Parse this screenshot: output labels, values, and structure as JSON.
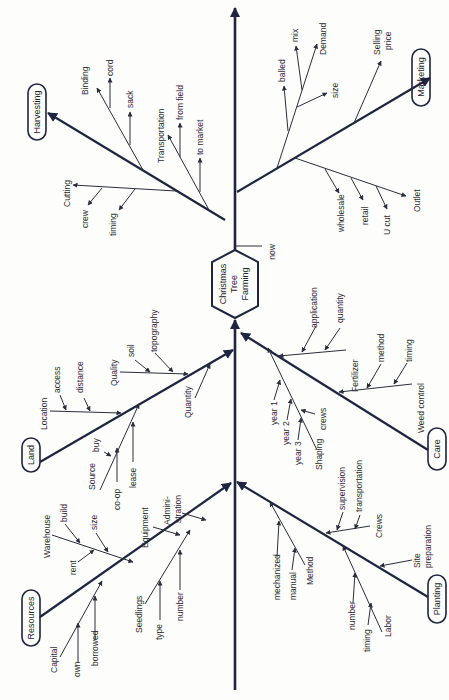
{
  "diagram": {
    "type": "fishbone",
    "head": "Christmas Tree Farming",
    "head_side_label": "now",
    "colors": {
      "ink": "#1f2440",
      "paper": "#fdfdfb"
    },
    "categories": {
      "harvesting": {
        "label": "Harvesting",
        "causes": [
          {
            "label": "Binding",
            "sub": [
              "cord",
              "sack"
            ]
          },
          {
            "label": "Transportation",
            "sub": [
              "from field",
              "to market"
            ]
          },
          {
            "label": "Cutting",
            "sub": [
              "crew",
              "timing"
            ]
          }
        ]
      },
      "marketing": {
        "label": "Marketing",
        "causes": [
          {
            "label": "Demand",
            "sub": [
              "balled",
              "mix",
              "size"
            ]
          },
          {
            "label": "Selling price",
            "sub": []
          },
          {
            "label": "Outlet",
            "sub": [
              "wholesale",
              "retail",
              "U cut"
            ]
          }
        ]
      },
      "land": {
        "label": "Land",
        "causes": [
          {
            "label": "Location",
            "sub": [
              "access",
              "distance"
            ]
          },
          {
            "label": "Quality",
            "sub": [
              "soil",
              "topography"
            ]
          },
          {
            "label": "Quantity",
            "sub": []
          },
          {
            "label": "Source",
            "sub": [
              "buy",
              "co-op",
              "lease"
            ]
          }
        ]
      },
      "care": {
        "label": "Care",
        "causes": [
          {
            "label": "Fertilizer",
            "sub": [
              "application",
              "quantity"
            ]
          },
          {
            "label": "Weed control",
            "sub": [
              "method",
              "timing"
            ]
          },
          {
            "label": "Shaping",
            "sub": [
              "year 1",
              "year 2",
              "year 3",
              "crews"
            ]
          }
        ]
      },
      "resources": {
        "label": "Resources",
        "causes": [
          {
            "label": "Warehouse",
            "sub": [
              "build",
              "size",
              "rent"
            ]
          },
          {
            "label": "Equipment",
            "sub": []
          },
          {
            "label": "Admini-",
            "label2": "stration",
            "sub": []
          },
          {
            "label": "Capital",
            "sub": [
              "own",
              "borrowed"
            ]
          },
          {
            "label": "Seedlings",
            "sub": [
              "type",
              "number"
            ]
          }
        ]
      },
      "planting": {
        "label": "Planting",
        "causes": [
          {
            "label": "Crews",
            "sub": [
              "supervision",
              "transportation"
            ]
          },
          {
            "label": "Site",
            "label2": "preparation",
            "sub": []
          },
          {
            "label": "Method",
            "sub": [
              "mechanized",
              "manual"
            ]
          },
          {
            "label": "Labor",
            "sub": [
              "number",
              "timing"
            ]
          }
        ]
      }
    }
  }
}
